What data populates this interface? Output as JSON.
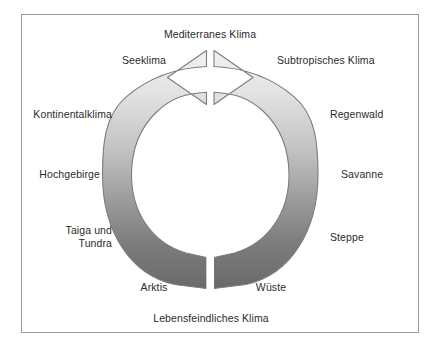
{
  "diagram": {
    "title_label": "Mediterranes Klima",
    "bottom_label": "Lebensfeindliches Klima",
    "type": "climate-cycle-ring",
    "colors": {
      "ring_top": "#ececec",
      "ring_bottom": "#6e6e6e",
      "ring_outline": "#808080",
      "frame_border": "#9a9a9a",
      "background": "#ffffff",
      "text": "#2b2b2b"
    },
    "labels": {
      "mediterranes_klima": "Mediterranes Klima",
      "seeklima": "Seeklima",
      "subtropisches_klima": "Subtropisches Klima",
      "kontinentalklima": "Kontinentalklima",
      "regenwald": "Regenwald",
      "hochgebirge": "Hochgebirge",
      "savanne": "Savanne",
      "taiga_und_tundra_line1": "Taiga und",
      "taiga_und_tundra_line2": "Tundra",
      "steppe": "Steppe",
      "arktis": "Arktis",
      "wueste": "Wüste",
      "lebensfeindliches_klima": "Lebensfeindliches Klima"
    },
    "ring_segments_left": [
      "Seeklima",
      "Kontinentalklima",
      "Hochgebirge",
      "Taiga und Tundra",
      "Arktis"
    ],
    "ring_segments_right": [
      "Subtropisches Klima",
      "Regenwald",
      "Savanne",
      "Steppe",
      "Wüste"
    ]
  }
}
